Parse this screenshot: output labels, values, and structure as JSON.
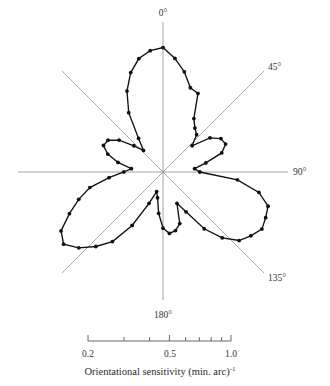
{
  "figure": {
    "title": "",
    "caption": "Orientational sensitivity (min. arc)",
    "caption_exponent": "-1"
  },
  "angle_labels": {
    "deg0": "0°",
    "deg45": "45°",
    "deg90": "90°",
    "deg135": "135°",
    "deg180": "180°"
  },
  "scale": {
    "labels": [
      "0.2",
      "0.5",
      "1.0"
    ],
    "type": "log",
    "min": 0.2,
    "max": 1.0,
    "ticks": [
      0.2,
      0.3,
      0.4,
      0.5,
      0.6,
      0.7,
      0.8,
      0.9,
      1.0
    ],
    "labeled_ticks": [
      0.2,
      0.5,
      1.0
    ]
  },
  "colors": {
    "data_stroke": "#111111",
    "axis": "#8e8e8e",
    "scale_axis": "#5a5a5a",
    "text": "#333333",
    "background": "#ffffff"
  },
  "chart_data": {
    "type": "line",
    "coordinate_system": "polar",
    "title": "",
    "xlabel": "Orientational sensitivity (min. arc)^-1",
    "ylabel": "",
    "rlim": [
      0.2,
      1.0
    ],
    "r_scale": "log",
    "grid": false,
    "legend": "none",
    "angle_axes_deg": [
      0,
      45,
      90,
      135,
      180,
      225,
      270,
      315
    ],
    "angle_unit": "degrees, clockwise from vertical",
    "theta": [
      0,
      6,
      12,
      18,
      24,
      30,
      36,
      42,
      48,
      54,
      60,
      66,
      72,
      78,
      84,
      90,
      96,
      102,
      108,
      114,
      120,
      126,
      132,
      138,
      144,
      150,
      156,
      162,
      168,
      174,
      180,
      186,
      192,
      198,
      204,
      210,
      216,
      222,
      228,
      234,
      240,
      246,
      252,
      258,
      264,
      270,
      276,
      282,
      288,
      294,
      300,
      306,
      312,
      318,
      324,
      330,
      336,
      342,
      348,
      354
    ],
    "r": [
      0.98,
      0.86,
      0.74,
      0.62,
      0.6,
      0.44,
      0.4,
      0.38,
      0.33,
      0.42,
      0.47,
      0.48,
      0.44,
      0.35,
      0.3,
      0.32,
      0.52,
      0.7,
      0.82,
      0.84,
      0.86,
      0.8,
      0.74,
      0.62,
      0.49,
      0.36,
      0.31,
      0.4,
      0.43,
      0.44,
      0.41,
      0.34,
      0.28,
      0.26,
      0.31,
      0.44,
      0.6,
      0.72,
      0.85,
      0.96,
      0.9,
      0.74,
      0.62,
      0.52,
      0.4,
      0.33,
      0.3,
      0.36,
      0.42,
      0.46,
      0.45,
      0.4,
      0.33,
      0.29,
      0.34,
      0.48,
      0.62,
      0.76,
      0.88,
      0.95
    ],
    "series_name": "orientational sensitivity"
  }
}
